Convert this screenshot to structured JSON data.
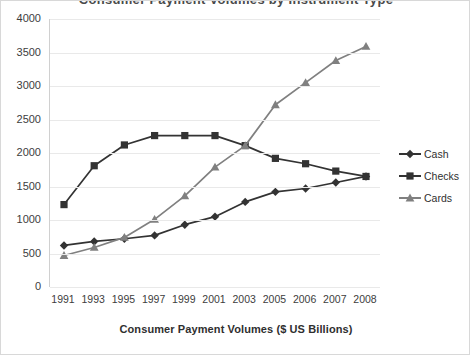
{
  "title": {
    "text": "Consumer Payment Volumes by Instrument Type",
    "cropped": true
  },
  "axis_title": "Consumer Payment Volumes ($ US Billions)",
  "legend": {
    "position": "right",
    "items": [
      {
        "label": "Cash",
        "marker": "diamond-marker",
        "color": "#333333"
      },
      {
        "label": "Checks",
        "marker": "square-marker",
        "color": "#333333"
      },
      {
        "label": "Cards",
        "marker": "triangle-marker",
        "color": "#808080"
      }
    ]
  },
  "chart_data": {
    "type": "line",
    "title": "Consumer Payment Volumes by Instrument Type",
    "xlabel": "Consumer Payment Volumes ($ US Billions)",
    "ylabel": "",
    "ylim": [
      0,
      4000
    ],
    "ytick_step": 500,
    "grid": true,
    "categories": [
      "1991",
      "1993",
      "1995",
      "1997",
      "1999",
      "2001",
      "2003",
      "2005",
      "2006",
      "2007",
      "2008"
    ],
    "yticks": [
      "0",
      "500",
      "1000",
      "1500",
      "2000",
      "2500",
      "3000",
      "3500",
      "4000"
    ],
    "series": [
      {
        "name": "Cash",
        "color": "#333333",
        "marker": "diamond",
        "values": [
          620,
          680,
          720,
          770,
          930,
          1050,
          1270,
          1420,
          1470,
          1560,
          1650
        ]
      },
      {
        "name": "Checks",
        "color": "#333333",
        "marker": "square",
        "values": [
          1230,
          1810,
          2120,
          2260,
          2260,
          2260,
          2110,
          1920,
          1840,
          1730,
          1650
        ]
      },
      {
        "name": "Cards",
        "color": "#808080",
        "marker": "triangle",
        "values": [
          470,
          590,
          740,
          1010,
          1360,
          1790,
          2110,
          2720,
          3050,
          3380,
          3590
        ]
      }
    ]
  }
}
